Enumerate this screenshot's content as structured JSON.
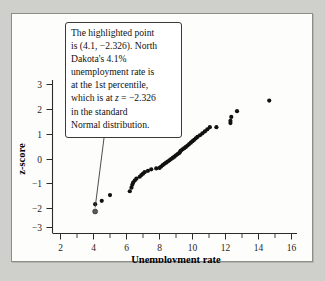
{
  "figure": {
    "background_color": "#fdfdfc",
    "page_background_color": "#cfcfcb",
    "border_color": "#8d8d88"
  },
  "annotation": {
    "name": "highlighted-point-callout",
    "line1": "The highlighted point",
    "line2": "is (4.1, −2.326).  North",
    "line3": "Dakota's 4.1%",
    "line4": "unemployment rate is",
    "line5": "at the 1st percentile,",
    "line6_a": "which is at ",
    "line6_z": "z",
    "line6_b": " = −2.326",
    "line7": "in the standard",
    "line8": "Normal distribution.",
    "full_text": "The highlighted point is (4.1, −2.326).  North Dakota's 4.1% unemployment rate is at the 1st percentile, which is at z = −2.326 in the standard Normal distribution."
  },
  "chart_data": {
    "type": "scatter",
    "title": "",
    "xlabel": "Unemployment rate",
    "ylabel": "z-score",
    "xlim": [
      1.2,
      16.9
    ],
    "ylim": [
      -3.55,
      3.55
    ],
    "grid": false,
    "legend": null,
    "xticks": [
      2,
      4,
      6,
      8,
      10,
      12,
      14,
      16
    ],
    "xticklabels": [
      "2",
      "4",
      "6",
      "8",
      "10",
      "12",
      "14",
      "16"
    ],
    "xminorticks": [
      3,
      5,
      7,
      9,
      11,
      13,
      15
    ],
    "yticks": [
      3,
      2,
      1,
      0,
      -1,
      -2,
      -3
    ],
    "yticklabels": [
      "3",
      "2",
      "1",
      "0",
      "−1",
      "−2",
      "−3"
    ],
    "point_color": "#111111",
    "marker_size": 2.1,
    "highlighted_point": {
      "x": 4.1,
      "y": -2.326,
      "label": "North Dakota"
    },
    "points": [
      [
        4.1,
        -2.326
      ],
      [
        4.1,
        -2.02
      ],
      [
        4.5,
        -1.88
      ],
      [
        5.0,
        -1.64
      ],
      [
        6.2,
        -1.48
      ],
      [
        6.3,
        -1.33
      ],
      [
        6.35,
        -1.21
      ],
      [
        6.4,
        -1.12
      ],
      [
        6.5,
        -1.03
      ],
      [
        6.6,
        -0.95
      ],
      [
        6.8,
        -0.87
      ],
      [
        6.9,
        -0.8
      ],
      [
        7.0,
        -0.74
      ],
      [
        7.1,
        -0.68
      ],
      [
        7.3,
        -0.62
      ],
      [
        7.5,
        -0.56
      ],
      [
        7.8,
        -0.52
      ],
      [
        8.0,
        -0.5
      ],
      [
        8.1,
        -0.44
      ],
      [
        8.2,
        -0.38
      ],
      [
        8.3,
        -0.33
      ],
      [
        8.4,
        -0.28
      ],
      [
        8.5,
        -0.23
      ],
      [
        8.6,
        -0.18
      ],
      [
        8.7,
        -0.13
      ],
      [
        8.8,
        -0.08
      ],
      [
        8.9,
        -0.03
      ],
      [
        9.0,
        0.03
      ],
      [
        9.1,
        0.08
      ],
      [
        9.2,
        0.13
      ],
      [
        9.25,
        0.18
      ],
      [
        9.3,
        0.23
      ],
      [
        9.4,
        0.28
      ],
      [
        9.5,
        0.33
      ],
      [
        9.6,
        0.38
      ],
      [
        9.7,
        0.44
      ],
      [
        9.8,
        0.5
      ],
      [
        9.9,
        0.56
      ],
      [
        10.0,
        0.62
      ],
      [
        10.1,
        0.68
      ],
      [
        10.2,
        0.74
      ],
      [
        10.3,
        0.8
      ],
      [
        10.45,
        0.87
      ],
      [
        10.6,
        0.95
      ],
      [
        10.75,
        1.03
      ],
      [
        10.9,
        1.12
      ],
      [
        11.05,
        1.21
      ],
      [
        11.45,
        1.21
      ],
      [
        12.3,
        1.38
      ],
      [
        12.3,
        1.48
      ],
      [
        12.35,
        1.64
      ],
      [
        12.7,
        1.88
      ],
      [
        14.65,
        2.326
      ]
    ]
  }
}
